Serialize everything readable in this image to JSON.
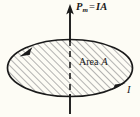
{
  "figure": {
    "background_color": "#fdfcf5",
    "ink_color": "#1a1a1a",
    "hatch_color": "#8c8c8c"
  },
  "labels": {
    "moment_symbol": "P",
    "moment_subscript": "m",
    "moment_equals": "=",
    "moment_value": "IA",
    "area_text": "Area",
    "area_symbol": "A",
    "current_symbol": "I"
  },
  "geometry": {
    "ellipse": {
      "center_x": 70,
      "center_y": 68,
      "radius_x": 63,
      "radius_y": 29
    },
    "axis": {
      "x": 70,
      "arrow_tip_y": 5,
      "bottom_y": 113,
      "dashed_from_y": 39,
      "dashed_to_y": 97
    },
    "arrowheads": [
      {
        "name": "moment-arrowhead",
        "x": 70,
        "y": 5,
        "direction": "up"
      },
      {
        "name": "loop-arrowhead-left",
        "x": 25,
        "y": 52,
        "direction": "down-left"
      },
      {
        "name": "loop-arrowhead-right",
        "x": 117,
        "y": 88,
        "direction": "up-right"
      }
    ]
  },
  "icons": {
    "moment_vector": "up-arrow-icon",
    "current_loop": "ellipse-loop-icon",
    "hatch_fill": "diagonal-hatch-icon"
  }
}
